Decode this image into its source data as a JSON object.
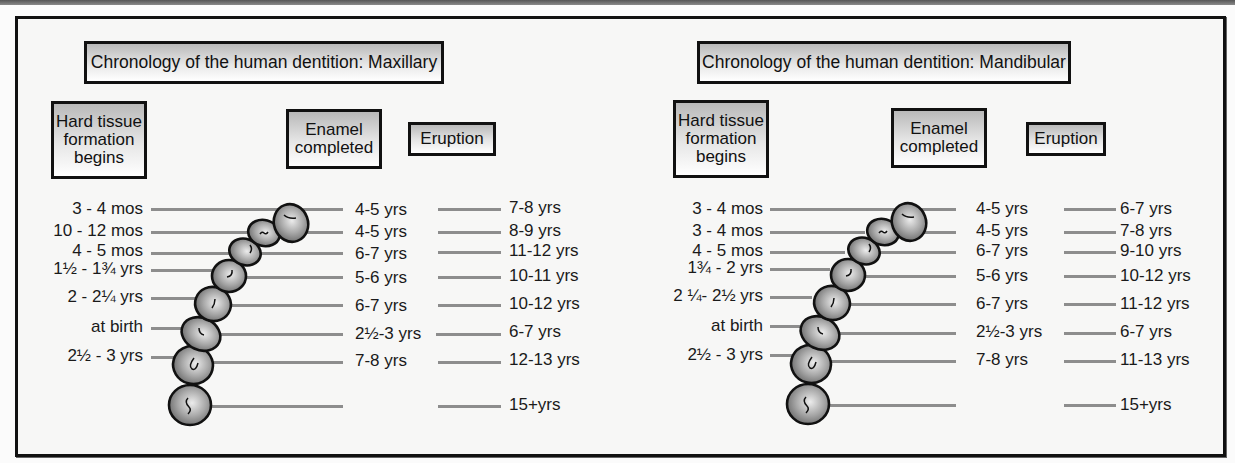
{
  "panels": [
    {
      "id": "maxillary",
      "title": "Chronology of the human dentition: Maxillary",
      "headers": {
        "formation": "Hard tissue formation begins",
        "formation_lines": [
          "Hard tissue",
          "formation",
          "begins"
        ],
        "enamel_lines": [
          "Enamel",
          "completed"
        ],
        "eruption": "Eruption"
      },
      "rows": [
        {
          "tooth": 1,
          "formation": "3 - 4 mos",
          "enamel": "4-5 yrs",
          "eruption": "7-8 yrs"
        },
        {
          "tooth": 2,
          "formation": "10 - 12 mos",
          "enamel": "4-5 yrs",
          "eruption": "8-9 yrs"
        },
        {
          "tooth": 3,
          "formation": "4 - 5 mos",
          "enamel": "6-7 yrs",
          "eruption": "11-12 yrs"
        },
        {
          "tooth": 4,
          "formation": "1½ - 1¾ yrs",
          "enamel": "5-6 yrs",
          "eruption": "10-11 yrs"
        },
        {
          "tooth": 5,
          "formation": "2 - 2¼ yrs",
          "enamel": "6-7 yrs",
          "eruption": "10-12 yrs"
        },
        {
          "tooth": 6,
          "formation": "at birth",
          "enamel": "2½-3 yrs",
          "eruption": "6-7 yrs"
        },
        {
          "tooth": 7,
          "formation": "2½ - 3 yrs",
          "enamel": "7-8 yrs",
          "eruption": "12-13 yrs"
        },
        {
          "tooth": 8,
          "formation": "",
          "enamel": "",
          "eruption": "15+yrs"
        }
      ]
    },
    {
      "id": "mandibular",
      "title": "Chronology of the human dentition: Mandibular",
      "headers": {
        "formation": "Hard tissue formation begins",
        "formation_lines": [
          "Hard tissue",
          "formation",
          "begins"
        ],
        "enamel_lines": [
          "Enamel",
          "completed"
        ],
        "eruption": "Eruption"
      },
      "rows": [
        {
          "tooth": 1,
          "formation": "3 - 4 mos",
          "enamel": "4-5 yrs",
          "eruption": "6-7 yrs"
        },
        {
          "tooth": 2,
          "formation": "3 - 4 mos",
          "enamel": "4-5 yrs",
          "eruption": "7-8 yrs"
        },
        {
          "tooth": 3,
          "formation": "4 - 5 mos",
          "enamel": "6-7 yrs",
          "eruption": "9-10 yrs"
        },
        {
          "tooth": 4,
          "formation": "1¾ - 2 yrs",
          "enamel": "5-6 yrs",
          "eruption": "10-12 yrs"
        },
        {
          "tooth": 5,
          "formation": "2 ¼- 2½ yrs",
          "enamel": "6-7 yrs",
          "eruption": "11-12 yrs"
        },
        {
          "tooth": 6,
          "formation": "at birth",
          "enamel": "2½-3 yrs",
          "eruption": "6-7 yrs"
        },
        {
          "tooth": 7,
          "formation": "2½ - 3 yrs",
          "enamel": "7-8 yrs",
          "eruption": "11-13 yrs"
        },
        {
          "tooth": 8,
          "formation": "",
          "enamel": "",
          "eruption": "15+yrs"
        }
      ]
    }
  ],
  "colors": {
    "frame": "#111111",
    "connector_line": "#8d8d8d",
    "tooth_fill_light": "#e8e8e8",
    "tooth_fill_dark": "#6e6e6e",
    "header_box_top": "#b9b9b9",
    "header_box_bottom": "#ffffff",
    "background": "#f7f7f6"
  }
}
